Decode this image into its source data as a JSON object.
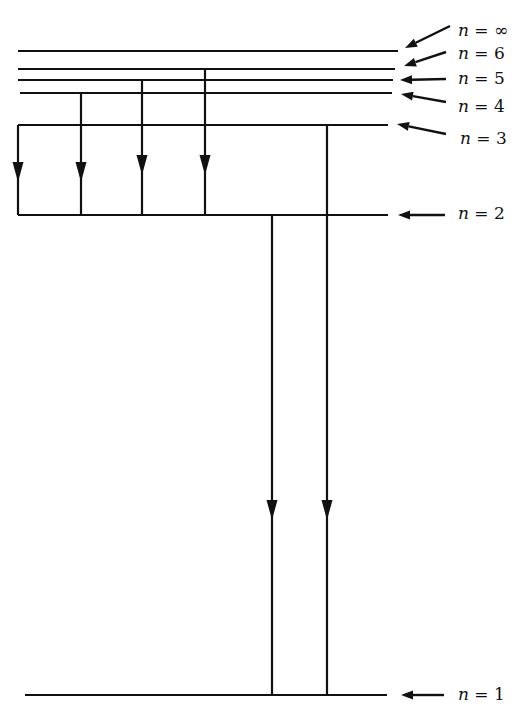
{
  "diagram": {
    "type": "energy-level-diagram",
    "line_color": "#111111",
    "levels": [
      {
        "n": "∞",
        "label": "n = ∞",
        "y": 51,
        "x1": 18,
        "x2": 398,
        "label_x": 458,
        "label_y": 20,
        "arrow": {
          "x1": 450,
          "y1": 26,
          "x2": 405,
          "y2": 48
        }
      },
      {
        "n": "6",
        "label": "n = 6",
        "y": 69,
        "x1": 18,
        "x2": 395,
        "label_x": 458,
        "label_y": 43,
        "arrow": {
          "x1": 446,
          "y1": 52,
          "x2": 404,
          "y2": 66
        }
      },
      {
        "n": "5",
        "label": "n = 5",
        "y": 80,
        "x1": 18,
        "x2": 393,
        "label_x": 458,
        "label_y": 68,
        "arrow": {
          "x1": 446,
          "y1": 79,
          "x2": 400,
          "y2": 80
        }
      },
      {
        "n": "4",
        "label": "n = 4",
        "y": 93,
        "x1": 20,
        "x2": 392,
        "label_x": 458,
        "label_y": 96,
        "arrow": {
          "x1": 446,
          "y1": 102,
          "x2": 401,
          "y2": 94
        }
      },
      {
        "n": "3",
        "label": "n = 3",
        "y": 125,
        "x1": 18,
        "x2": 388,
        "label_x": 460,
        "label_y": 128,
        "arrow": {
          "x1": 446,
          "y1": 134,
          "x2": 397,
          "y2": 124
        }
      },
      {
        "n": "2",
        "label": "n = 2",
        "y": 215,
        "x1": 18,
        "x2": 388,
        "label_x": 458,
        "label_y": 203,
        "arrow": {
          "x1": 445,
          "y1": 215,
          "x2": 398,
          "y2": 215
        }
      },
      {
        "n": "1",
        "label": "n = 1",
        "y": 695,
        "x1": 25,
        "x2": 387,
        "label_x": 458,
        "label_y": 684,
        "arrow": {
          "x1": 444,
          "y1": 695,
          "x2": 401,
          "y2": 695
        }
      }
    ],
    "transitions": [
      {
        "from": "3",
        "to": "2",
        "x": 18,
        "y1": 125,
        "y2": 215,
        "arrow_y": 172
      },
      {
        "from": "4",
        "to": "2",
        "x": 81,
        "y1": 93,
        "y2": 215,
        "arrow_y": 172
      },
      {
        "from": "5",
        "to": "2",
        "x": 142,
        "y1": 80,
        "y2": 215,
        "arrow_y": 165
      },
      {
        "from": "6",
        "to": "2",
        "x": 205,
        "y1": 69,
        "y2": 215,
        "arrow_y": 165
      },
      {
        "from": "2",
        "to": "1",
        "x": 272,
        "y1": 215,
        "y2": 695,
        "arrow_y": 510
      },
      {
        "from": "3",
        "to": "1",
        "x": 327,
        "y1": 125,
        "y2": 695,
        "arrow_y": 510
      }
    ]
  }
}
